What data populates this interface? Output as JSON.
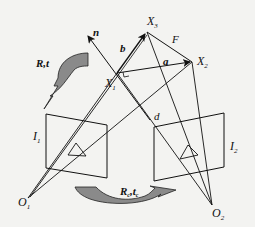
{
  "diagram": {
    "points": {
      "X1": {
        "label": "X",
        "sub": "1"
      },
      "X2": {
        "label": "X",
        "sub": "2"
      },
      "X3": {
        "label": "X",
        "sub": "3"
      },
      "O1": {
        "label": "O",
        "sub": "1"
      },
      "O2": {
        "label": "O",
        "sub": "2"
      }
    },
    "vectors": {
      "n": "n",
      "a": "a",
      "b": "b"
    },
    "edges": {
      "F": "F",
      "d": "d"
    },
    "image_planes": {
      "I1": {
        "label": "I",
        "sub": "1"
      },
      "I2": {
        "label": "I",
        "sub": "2"
      }
    },
    "transforms": {
      "rt": {
        "R": "R",
        "comma": ",",
        "t": "t"
      },
      "rete": {
        "R": "R",
        "rsub": "c",
        "comma": ",",
        "t": "t",
        "tsub": "c"
      }
    },
    "colors": {
      "ink": "#111111",
      "arrow_fill": "#8a8a8a",
      "background": "#f3f3f1"
    }
  }
}
